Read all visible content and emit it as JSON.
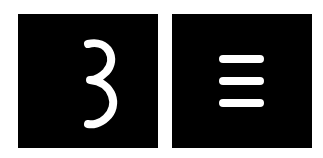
{
  "tiles": [
    {
      "name": "digit-three",
      "label": "3",
      "background": "#000000",
      "foreground": "#ffffff",
      "icon": "digit-3-glyph"
    },
    {
      "name": "triple-bar",
      "label": "≡",
      "background": "#000000",
      "foreground": "#ffffff",
      "icon": "three-horizontal-lines-glyph"
    }
  ]
}
